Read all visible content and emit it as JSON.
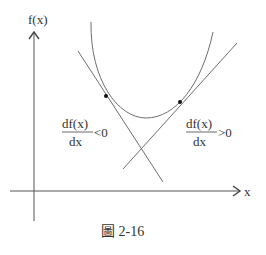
{
  "figure": {
    "caption": "圖 2-16",
    "y_axis_label": "f(x)",
    "x_axis_label": "x",
    "left_annotation": {
      "numerator": "df(x)",
      "denominator": "dx",
      "relation": "<0"
    },
    "right_annotation": {
      "numerator": "df(x)",
      "denominator": "dx",
      "relation": ">0"
    },
    "colors": {
      "line": "#6e6e6e",
      "axis": "#555555",
      "text": "#333333",
      "point": "#111111"
    }
  }
}
